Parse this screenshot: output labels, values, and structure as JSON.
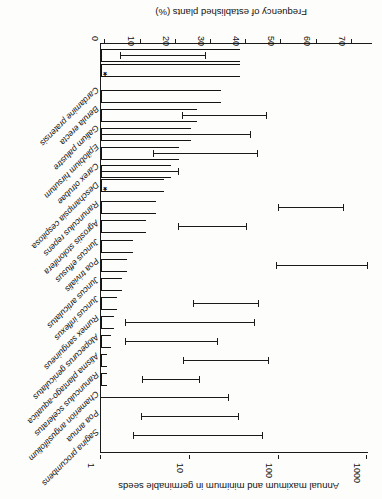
{
  "figure": {
    "top_axis": {
      "title": "Annual maximum and minimum in germinable seeds",
      "scale": "log",
      "ticks": [
        "1000",
        "100",
        "10",
        "1"
      ]
    },
    "bottom_axis": {
      "title": "Frequency of established plants (%)",
      "ticks": [
        "70",
        "60",
        "50",
        "40",
        "30",
        "20",
        "10",
        "0"
      ]
    },
    "significance_marker": "*"
  },
  "chart_data": {
    "type": "bar",
    "title": "Annual maximum and minimum in germinable seeds",
    "subtitle": "",
    "xlabel": "Frequency of established plants (%)",
    "ylabel": "",
    "orientation": "horizontal",
    "grid": false,
    "legend": "none",
    "xlim": [
      0,
      75
    ],
    "secondary_axis": {
      "label": "Annual maximum and minimum in germinable seeds",
      "scale": "log",
      "ticks": [
        1,
        10,
        100,
        1000
      ],
      "lim": [
        1,
        1000
      ]
    },
    "categories": [
      "Sagina procumbens",
      "Poa annua",
      "Chamerion angustifolium",
      "Ranunculus sceleratus",
      "Alisma plantago-aquatica",
      "Alopecurus geniculatus",
      "Rumex sanguineus",
      "Juncus inflexus",
      "Juncus articulatus",
      "Poa trivialis",
      "Juncus effusus",
      "Agrostis stolonifera",
      "Ranunculus repens",
      "Deschampsia cespitosa",
      "Carex otrubae",
      "Epilobium hirsutum",
      "Galium palustre",
      "Berula erecta",
      "Cardamine pratensis"
    ],
    "series": [
      {
        "name": "Frequency of established plants (%)",
        "values": [
          0,
          0,
          0,
          0.6,
          0.9,
          1.2,
          2.4,
          3.6,
          4.5,
          5.8,
          8.4,
          12.0,
          15.2,
          17.5,
          22.0,
          25.5,
          26.5,
          34.0,
          39.8
        ]
      }
    ],
    "error_bars": {
      "name": "Annual maximum and minimum in germinable seeds",
      "axis": "secondary-log",
      "ranges": [
        {
          "category": "Sagina procumbens",
          "min": 19,
          "max": 220
        },
        {
          "category": "Poa annua",
          "min": 22,
          "max": 120
        },
        {
          "category": "Chamerion angustifolium",
          "min": 1.1,
          "max": 105
        },
        {
          "category": "Ranunculus sceleratus",
          "min": 21,
          "max": 60
        },
        {
          "category": "Alisma plantago-aquatica",
          "min": 43,
          "max": 340
        },
        {
          "category": "Alopecurus geniculatus",
          "min": 2.4,
          "max": 50
        },
        {
          "category": "Rumex sanguineus",
          "min": 1.3,
          "max": 135
        },
        {
          "category": "Juncus inflexus",
          "min": 32,
          "max": 330
        },
        {
          "category": "Juncus articulatus",
          "min": 1.0,
          "max": 1.0
        },
        {
          "category": "Poa trivialis",
          "min": 30,
          "max": 280
        },
        {
          "category": "Juncus effusus",
          "min": 1.0,
          "max": 1.0
        },
        {
          "category": "Agrostis stolonifera",
          "min": 9.0,
          "max": 520
        },
        {
          "category": "Ranunculus repens",
          "min": 1.0,
          "max": 1.0
        },
        {
          "category": "Deschampsia cespitosa",
          "min": 1.2,
          "max": 5.5
        },
        {
          "category": "Carex otrubae",
          "min": 1.8,
          "max": 22
        },
        {
          "category": "Epilobium hirsutum",
          "min": 1.3,
          "max": 16
        },
        {
          "category": "Galium palustre",
          "min": 1.6,
          "max": 23
        },
        {
          "category": "Berula erecta",
          "min": 20,
          "max": 240
        },
        {
          "category": "Cardamine pratensis",
          "min": 1.0,
          "max": 3.0
        }
      ]
    },
    "annotations": [
      {
        "text": "*",
        "category": "Ranunculus repens",
        "meaning": "marked species"
      },
      {
        "text": "*",
        "category": "Berula erecta",
        "meaning": "marked species"
      }
    ]
  },
  "bars": [
    {
      "id": "b1",
      "label": "Sagina procumbens",
      "bar_px": 0,
      "row_y": 63,
      "err_from": 119,
      "err_to": 248,
      "star": false
    },
    {
      "id": "b2",
      "label": "Poa annua",
      "bar_px": 0,
      "row_y": 82,
      "err_from": 143,
      "err_to": 240,
      "star": false
    },
    {
      "id": "b3",
      "label": "Chamerion angustifolium",
      "bar_px": 0,
      "row_y": 101,
      "err_from": 153,
      "err_to": 281,
      "star": false
    },
    {
      "id": "b4",
      "label": "Ranunculus sceleratus",
      "bar_px": 6,
      "row_y": 119,
      "err_from": 182,
      "err_to": 239,
      "star": false
    },
    {
      "id": "b5",
      "label": "Alisma plantago-aquatica",
      "bar_px": 6,
      "row_y": 138,
      "err_from": 113,
      "err_to": 198,
      "star": false
    },
    {
      "id": "b6",
      "label": "Alopecurus geniculatus",
      "bar_px": 10,
      "row_y": 157,
      "err_from": 164,
      "err_to": 256,
      "star": false
    },
    {
      "id": "b7",
      "label": "Rumex sanguineus",
      "bar_px": 13,
      "row_y": 176,
      "err_from": 127,
      "err_to": 256,
      "star": false
    },
    {
      "id": "b8",
      "label": "Juncus inflexus",
      "bar_px": 16,
      "row_y": 195,
      "err_from": 123,
      "err_to": 188,
      "star": false
    },
    {
      "id": "b9",
      "label": "Juncus articulatus",
      "bar_px": 21,
      "row_y": 214,
      "err_from": 0,
      "err_to": 0,
      "star": false
    },
    {
      "id": "b10",
      "label": "Poa trivialis",
      "bar_px": 26,
      "row_y": 233,
      "err_from": 14,
      "err_to": 105,
      "star": false
    },
    {
      "id": "b11",
      "label": "Juncus effusus",
      "bar_px": 32,
      "row_y": 252,
      "err_from": 0,
      "err_to": 0,
      "star": false
    },
    {
      "id": "b12",
      "label": "Agrostis stolonifera",
      "bar_px": 45,
      "row_y": 272,
      "err_from": 135,
      "err_to": 203,
      "star": false
    },
    {
      "id": "b13",
      "label": "Ranunculus repens",
      "bar_px": 55,
      "row_y": 291,
      "err_from": 38,
      "err_to": 103,
      "star": false
    },
    {
      "id": "b14",
      "label": "Deschampsia cespitosa",
      "bar_px": 63,
      "row_y": 313,
      "err_from": 0,
      "err_to": 0,
      "star": true
    },
    {
      "id": "b15",
      "label": "Carex otrubae",
      "bar_px": 70,
      "row_y": 327,
      "err_from": 203,
      "err_to": 280,
      "star": false
    },
    {
      "id": "b16",
      "label": "Epilobium hirsutum",
      "bar_px": 78,
      "row_y": 345,
      "err_from": 124,
      "err_to": 228,
      "star": false
    },
    {
      "id": "b17",
      "label": "Galium palustre",
      "bar_px": 90,
      "row_y": 364,
      "err_from": 131,
      "err_to": 281,
      "star": false
    },
    {
      "id": "b18",
      "label": "Berula erecta",
      "bar_px": 96,
      "row_y": 383,
      "err_from": 115,
      "err_to": 199,
      "star": false
    },
    {
      "id": "b19",
      "label": "Cardamine pratensis",
      "bar_px": 120,
      "row_y": 402,
      "err_from": 0,
      "err_to": 0,
      "star": false
    },
    {
      "id": "b20",
      "label": "",
      "bar_px": 139,
      "row_y": 428,
      "err_from": 0,
      "err_to": 0,
      "star": true
    },
    {
      "id": "b21",
      "label": "",
      "bar_px": 139,
      "row_y": 443,
      "err_from": 176,
      "err_to": 261,
      "star": false
    }
  ]
}
